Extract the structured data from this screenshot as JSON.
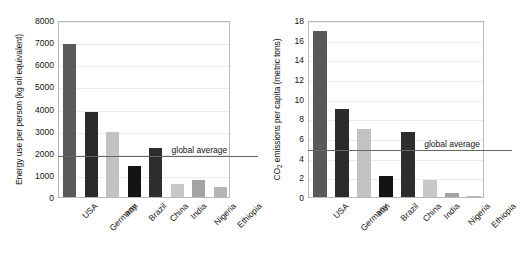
{
  "chart_data": [
    {
      "type": "bar",
      "panel": "left",
      "title": "",
      "xlabel": "",
      "ylabel": "Energy use per person (kg oil equivalent)",
      "categories": [
        "USA",
        "Germany",
        "Iran",
        "Brazil",
        "China",
        "India",
        "Nigeria",
        "Ethiopia"
      ],
      "values": [
        6900,
        3850,
        2930,
        1420,
        2200,
        570,
        750,
        470
      ],
      "colors": [
        "#595959",
        "#2b2b2b",
        "#c2c2c2",
        "#141414",
        "#2e2e2e",
        "#c8c8c8",
        "#a3a3a3",
        "#b5b5b5"
      ],
      "ylim": [
        0,
        8000
      ],
      "yticks": [
        0,
        1000,
        2000,
        3000,
        4000,
        5000,
        6000,
        7000,
        8000
      ],
      "ytick_labels": [
        "0",
        "1000",
        "2000",
        "3000",
        "4000",
        "5000",
        "6000",
        "7000",
        "8000"
      ],
      "grid": true,
      "legend": "none",
      "annotations": [
        {
          "name": "global-average",
          "label": "global average",
          "value": 1900
        }
      ]
    },
    {
      "type": "bar",
      "panel": "right",
      "title": "",
      "xlabel": "",
      "ylabel_pre": "CO",
      "ylabel_sub": "2",
      "ylabel_post": " emissions per capita (metric tons)",
      "ylabel": "CO2 emissions per capita (metric tons)",
      "categories": [
        "USA",
        "Germany",
        "Iran",
        "Brazil",
        "China",
        "India",
        "Nigeria",
        "Ethiopia"
      ],
      "values": [
        16.9,
        8.9,
        6.9,
        2.1,
        6.6,
        1.7,
        0.4,
        0.1
      ],
      "colors": [
        "#595959",
        "#2b2b2b",
        "#c2c2c2",
        "#141414",
        "#2e2e2e",
        "#c8c8c8",
        "#a3a3a3",
        "#b5b5b5"
      ],
      "ylim": [
        0,
        18
      ],
      "yticks": [
        0,
        2,
        4,
        6,
        8,
        10,
        12,
        14,
        16,
        18
      ],
      "ytick_labels": [
        "0",
        "2",
        "4",
        "6",
        "8",
        "10",
        "12",
        "14",
        "16",
        "18"
      ],
      "grid": true,
      "legend": "none",
      "annotations": [
        {
          "name": "global-average",
          "label": "global average",
          "value": 4.9
        }
      ]
    }
  ]
}
